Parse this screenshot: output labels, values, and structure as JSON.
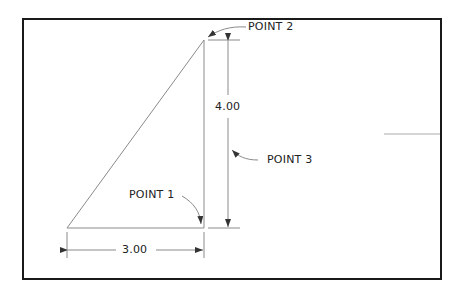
{
  "diagram": {
    "title": "",
    "colors": {
      "frame": "#1a1a1a",
      "lines": "#7a7a7a",
      "text": "#222222"
    },
    "points": [
      {
        "id": "point1",
        "label": "POINT 1"
      },
      {
        "id": "point2",
        "label": "POINT 2"
      },
      {
        "id": "point3",
        "label": "POINT 3"
      }
    ],
    "dimensions": {
      "horizontal": "3.00",
      "vertical": "4.00"
    }
  }
}
